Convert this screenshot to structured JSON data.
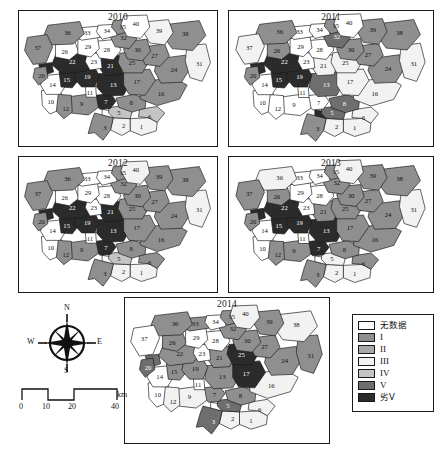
{
  "figure": {
    "kind": "choropleth-map-series",
    "panels": [
      {
        "year": "2010",
        "x": 18,
        "y": 10,
        "w": 200,
        "h": 137
      },
      {
        "year": "2011",
        "x": 228,
        "y": 10,
        "w": 206,
        "h": 137
      },
      {
        "year": "2012",
        "x": 18,
        "y": 156,
        "w": 200,
        "h": 137
      },
      {
        "year": "2013",
        "x": 228,
        "y": 156,
        "w": 206,
        "h": 137
      },
      {
        "year": "2014",
        "x": 124,
        "y": 297,
        "w": 206,
        "h": 147
      }
    ]
  },
  "legend": {
    "title": "",
    "items": [
      {
        "label": "无数据",
        "class_key": "nodata",
        "color": "#ffffff",
        "cjk": true
      },
      {
        "label": "I",
        "class_key": "I",
        "color": "#8f8f8f",
        "cjk": false
      },
      {
        "label": "II",
        "class_key": "II",
        "color": "#a8a8a8",
        "cjk": false
      },
      {
        "label": "III",
        "class_key": "III",
        "color": "#f2f2f2",
        "cjk": false
      },
      {
        "label": "IV",
        "class_key": "IV",
        "color": "#c4c4c4",
        "cjk": false
      },
      {
        "label": "V",
        "class_key": "V",
        "color": "#6e6e6e",
        "cjk": false
      },
      {
        "label": "劣V",
        "class_key": "worseV",
        "color": "#2b2b2b",
        "cjk": true
      }
    ]
  },
  "compass": {
    "north": "N",
    "south": "S",
    "east": "E",
    "west": "W"
  },
  "scalebar": {
    "unit": "km",
    "ticks": [
      "0",
      "10",
      "20",
      "40"
    ],
    "tick_fracs": [
      0,
      0.25,
      0.5,
      1.0
    ]
  },
  "palette": {
    "nodata": "#ffffff",
    "I": "#8f8f8f",
    "II": "#a8a8a8",
    "III": "#f2f2f2",
    "IV": "#c4c4c4",
    "V": "#6e6e6e",
    "worseV": "#2b2b2b"
  },
  "region_geometry": [
    {
      "id": 1,
      "label": "1",
      "cx": 143,
      "cy": 128,
      "d": "M131 118 L151 117 L160 122 L159 131 L143 136 L131 131 Z"
    },
    {
      "id": 2,
      "label": "2",
      "cx": 124,
      "cy": 126,
      "d": "M113 117 L131 118 L131 131 L122 136 L110 130 Z"
    },
    {
      "id": 3,
      "label": "3",
      "cx": 104,
      "cy": 129,
      "d": "M93 112 L113 117 L110 130 L102 141 L93 133 L86 134 L90 120 Z"
    },
    {
      "id": 4,
      "label": "",
      "cx": 107,
      "cy": 113,
      "d": "M101 108 L113 110 L113 117 L101 114 Z"
    },
    {
      "id": 5,
      "label": "5",
      "cx": 119,
      "cy": 112,
      "d": "M108 106 L127 104 L133 111 L131 118 L113 117 L108 112 Z"
    },
    {
      "id": 6,
      "label": "6",
      "cx": 152,
      "cy": 117,
      "d": "M141 108 L160 105 L168 112 L160 122 L151 117 L140 116 Z"
    },
    {
      "id": 7,
      "label": "7",
      "cx": 105,
      "cy": 101,
      "d": "M94 93 L110 91 L116 99 L110 107 L99 108 L92 102 Z"
    },
    {
      "id": 8,
      "label": "8",
      "cx": 132,
      "cy": 102,
      "d": "M116 96 L135 92 L148 97 L147 107 L133 111 L119 106 Z"
    },
    {
      "id": 9,
      "label": "9",
      "cx": 79,
      "cy": 103,
      "d": "M62 95 L84 92 L95 95 L97 106 L86 114 L68 112 L61 104 Z"
    },
    {
      "id": 10,
      "label": "10",
      "cx": 46,
      "cy": 101,
      "d": "M36 88 L54 86 L60 96 L57 108 L45 113 L37 104 Z"
    },
    {
      "id": 11,
      "label": "11",
      "cx": 88,
      "cy": 91,
      "d": "M83 83 L94 83 L95 95 L84 95 Z"
    },
    {
      "id": 12,
      "label": "12",
      "cx": 62,
      "cy": 108,
      "d": "M54 92 L68 93 L69 111 L60 118 L52 110 Z"
    },
    {
      "id": 13,
      "label": "13",
      "cx": 113,
      "cy": 82,
      "d": "M97 70 L124 68 L131 80 L124 93 L104 94 L95 84 Z"
    },
    {
      "id": 14,
      "label": "14",
      "cx": 48,
      "cy": 82,
      "d": "M38 72 L58 70 L63 81 L56 92 L41 92 L35 82 Z"
    },
    {
      "id": 15,
      "label": "15",
      "cx": 63,
      "cy": 77,
      "d": "M55 68 L72 65 L77 75 L69 85 L57 84 Z"
    },
    {
      "id": 16,
      "label": "16",
      "cx": 164,
      "cy": 92,
      "d": "M140 79 L177 74 L192 82 L184 97 L160 104 L142 97 Z"
    },
    {
      "id": 17,
      "label": "17",
      "cx": 138,
      "cy": 79,
      "d": "M124 68 L152 65 L158 77 L147 93 L130 92 L124 82 Z"
    },
    {
      "id": 18,
      "label": "",
      "cx": 40,
      "cy": 66,
      "d": "M33 60 L47 58 L49 68 L37 72 Z"
    },
    {
      "id": 19,
      "label": "19",
      "cx": 85,
      "cy": 74,
      "d": "M73 65 L93 63 L98 72 L93 84 L79 84 L71 75 Z"
    },
    {
      "id": 20,
      "label": "20",
      "cx": 36,
      "cy": 73,
      "d": "M29 64 L41 62 L43 74 L33 82 L27 74 Z"
    },
    {
      "id": 21,
      "label": "21",
      "cx": 110,
      "cy": 62,
      "d": "M100 52 L119 50 L125 60 L121 71 L104 72 L97 62 Z"
    },
    {
      "id": 22,
      "label": "22",
      "cx": 69,
      "cy": 58,
      "d": "M52 48 L85 44 L92 55 L83 67 L58 70 L47 60 Z"
    },
    {
      "id": 23,
      "label": "23",
      "cx": 92,
      "cy": 58,
      "d": "M85 48 L99 48 L101 64 L88 66 L83 57 Z"
    },
    {
      "id": 24,
      "label": "24",
      "cx": 178,
      "cy": 66,
      "d": "M160 54 L190 50 L196 63 L186 79 L164 80 L157 67 Z"
    },
    {
      "id": 25,
      "label": "25",
      "cx": 133,
      "cy": 59,
      "d": "M120 48 L145 45 L151 57 L144 69 L124 69 L118 58 Z"
    },
    {
      "id": 26,
      "label": "26",
      "cx": 61,
      "cy": 47,
      "d": "M51 38 L72 36 L76 47 L66 55 L51 52 Z"
    },
    {
      "id": 27,
      "label": "27",
      "cx": 157,
      "cy": 51,
      "d": "M146 41 L168 38 L173 51 L163 62 L147 60 L142 50 Z"
    },
    {
      "id": 28,
      "label": "28",
      "cx": 106,
      "cy": 45,
      "d": "M96 35 L117 33 L121 45 L113 55 L98 53 L93 44 Z"
    },
    {
      "id": 29,
      "label": "29",
      "cx": 86,
      "cy": 42,
      "d": "M75 33 L96 31 L98 43 L89 52 L75 49 Z"
    },
    {
      "id": 30,
      "label": "30",
      "cx": 139,
      "cy": 45,
      "d": "M128 35 L149 33 L153 46 L144 56 L128 54 L124 44 Z"
    },
    {
      "id": 31,
      "label": "31",
      "cx": 205,
      "cy": 60,
      "d": "M192 40 L212 38 L217 58 L208 78 L195 74 L190 56 Z"
    },
    {
      "id": 32,
      "label": "32",
      "cx": 124,
      "cy": 32,
      "d": "M114 23 L134 21 L138 33 L130 43 L115 41 L110 31 Z"
    },
    {
      "id": 33,
      "label": "33",
      "cx": 85,
      "cy": 27,
      "d": "M73 21 L97 19 L99 31 L79 34 L71 28 Z"
    },
    {
      "id": 34,
      "label": "34",
      "cx": 106,
      "cy": 25,
      "d": "M97 18 L115 17 L117 29 L101 33 L95 25 Z"
    },
    {
      "id": 35,
      "label": "35",
      "cx": 123,
      "cy": 20,
      "d": "M113 13 L133 12 L136 23 L118 28 L111 20 Z"
    },
    {
      "id": 36,
      "label": "36",
      "cx": 64,
      "cy": 27,
      "d": "M43 18 L77 14 L82 27 L70 38 L48 39 L39 28 Z"
    },
    {
      "id": 37,
      "label": "37",
      "cx": 32,
      "cy": 43,
      "d": "M21 31 L42 28 L48 41 L41 58 L27 60 L18 45 Z"
    },
    {
      "id": 38,
      "label": "38",
      "cx": 190,
      "cy": 28,
      "d": "M171 17 L205 13 L212 29 L198 45 L176 43 L166 29 Z"
    },
    {
      "id": 39,
      "label": "39",
      "cx": 162,
      "cy": 25,
      "d": "M150 14 L172 12 L177 26 L168 39 L152 37 L146 26 Z"
    },
    {
      "id": 40,
      "label": "40",
      "cx": 137,
      "cy": 17,
      "d": "M124 8 L149 7 L152 20 L142 32 L128 30 L121 18 Z"
    }
  ],
  "panel_classes": {
    "2010": {
      "1": "III",
      "2": "III",
      "3": "I",
      "4": "nodata",
      "5": "IV",
      "6": "IV",
      "7": "worseV",
      "8": "I",
      "9": "I",
      "10": "nodata",
      "11": "nodata",
      "12": "I",
      "13": "worseV",
      "14": "nodata",
      "15": "worseV",
      "16": "I",
      "17": "I",
      "18": "worseV",
      "19": "worseV",
      "20": "I",
      "21": "worseV",
      "22": "worseV",
      "23": "nodata",
      "24": "I",
      "25": "I",
      "26": "nodata",
      "27": "I",
      "28": "nodata",
      "29": "nodata",
      "30": "I",
      "31": "III",
      "32": "I",
      "33": "nodata",
      "34": "nodata",
      "35": "I",
      "36": "I",
      "37": "I",
      "38": "I",
      "39": "III",
      "40": "nodata"
    },
    "2011": {
      "1": "III",
      "2": "III",
      "3": "I",
      "4": "worseV",
      "5": "V",
      "6": "III",
      "7": "nodata",
      "8": "V",
      "9": "nodata",
      "10": "nodata",
      "11": "nodata",
      "12": "nodata",
      "13": "V",
      "14": "nodata",
      "15": "worseV",
      "16": "III",
      "17": "III",
      "18": "worseV",
      "19": "worseV",
      "20": "I",
      "21": "III",
      "22": "worseV",
      "23": "nodata",
      "24": "I",
      "25": "III",
      "26": "I",
      "27": "I",
      "28": "nodata",
      "29": "nodata",
      "30": "I",
      "31": "III",
      "32": "V",
      "33": "nodata",
      "34": "nodata",
      "35": "I",
      "36": "I",
      "37": "III",
      "38": "I",
      "39": "I",
      "40": "nodata"
    },
    "2012": {
      "1": "III",
      "2": "III",
      "3": "I",
      "4": "nodata",
      "5": "IV",
      "6": "I",
      "7": "worseV",
      "8": "I",
      "9": "I",
      "10": "nodata",
      "11": "nodata",
      "12": "I",
      "13": "worseV",
      "14": "nodata",
      "15": "worseV",
      "16": "I",
      "17": "I",
      "18": "worseV",
      "19": "worseV",
      "20": "I",
      "21": "worseV",
      "22": "worseV",
      "23": "nodata",
      "24": "I",
      "25": "I",
      "26": "nodata",
      "27": "I",
      "28": "nodata",
      "29": "nodata",
      "30": "I",
      "31": "III",
      "32": "I",
      "33": "nodata",
      "34": "nodata",
      "35": "I",
      "36": "I",
      "37": "I",
      "38": "I",
      "39": "I",
      "40": "III"
    },
    "2013": {
      "1": "III",
      "2": "III",
      "3": "I",
      "4": "nodata",
      "5": "III",
      "6": "I",
      "7": "worseV",
      "8": "I",
      "9": "I",
      "10": "nodata",
      "11": "nodata",
      "12": "I",
      "13": "worseV",
      "14": "nodata",
      "15": "worseV",
      "16": "I",
      "17": "I",
      "18": "worseV",
      "19": "worseV",
      "20": "I",
      "21": "I",
      "22": "worseV",
      "23": "nodata",
      "24": "I",
      "25": "I",
      "26": "I",
      "27": "I",
      "28": "nodata",
      "29": "nodata",
      "30": "I",
      "31": "III",
      "32": "I",
      "33": "nodata",
      "34": "nodata",
      "35": "I",
      "36": "III",
      "37": "I",
      "38": "I",
      "39": "I",
      "40": "III"
    },
    "2014": {
      "1": "III",
      "2": "III",
      "3": "V",
      "4": "nodata",
      "5": "V",
      "6": "III",
      "7": "I",
      "8": "I",
      "9": "III",
      "10": "nodata",
      "11": "nodata",
      "12": "III",
      "13": "I",
      "14": "nodata",
      "15": "I",
      "16": "III",
      "17": "worseV",
      "18": "V",
      "19": "I",
      "20": "V",
      "21": "I",
      "22": "I",
      "23": "nodata",
      "24": "I",
      "25": "worseV",
      "26": "I",
      "27": "I",
      "28": "nodata",
      "29": "nodata",
      "30": "I",
      "31": "I",
      "32": "I",
      "33": "I",
      "34": "nodata",
      "35": "I",
      "36": "I",
      "37": "nodata",
      "38": "III",
      "39": "I",
      "40": "III"
    }
  }
}
